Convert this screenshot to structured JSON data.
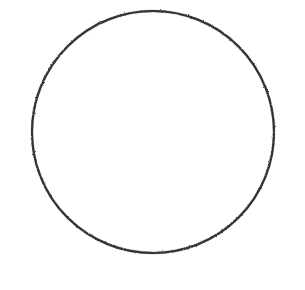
{
  "canvas": {
    "width": 305,
    "height": 290,
    "background_color": "#ffffff",
    "alt_text": "Hand-drawn circle outline on a white background"
  },
  "figure": {
    "name": "circle-outline",
    "shape_type": "circle",
    "center_x": 153,
    "center_y": 132,
    "radius": 121,
    "stroke_color": "#3c3c3c",
    "stroke_width": 2,
    "fill_color": "none",
    "texture": "grainy"
  },
  "annotations": {
    "title": "",
    "caption": "",
    "labels": []
  }
}
